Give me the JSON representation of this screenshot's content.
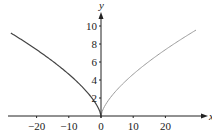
{
  "chart_data": {
    "type": "line",
    "title": "",
    "xlabel": "x",
    "ylabel": "y",
    "xlim": [
      -31,
      33
    ],
    "ylim": [
      0,
      11
    ],
    "x_ticks": [
      -20,
      -10,
      0,
      10,
      20
    ],
    "x_tick_labels": [
      "−20",
      "−10",
      "0",
      "10",
      "20"
    ],
    "y_ticks": [
      2,
      4,
      6,
      8,
      10
    ],
    "y_tick_labels": [
      "2",
      "4",
      "6",
      "8",
      "10"
    ],
    "grid": false,
    "legend": null,
    "series": [
      {
        "name": "left branch (x ≤ 0)",
        "color": "#444444",
        "x": [
          -28,
          -25,
          -20,
          -15,
          -10,
          -5,
          -2,
          0
        ],
        "y": [
          9.2,
          8.55,
          7.37,
          6.08,
          4.64,
          2.92,
          1.59,
          0
        ]
      },
      {
        "name": "right branch (x ≥ 0)",
        "color": "#9a9a9a",
        "x": [
          0,
          2,
          5,
          10,
          15,
          20,
          25,
          29.5
        ],
        "y": [
          0,
          1.59,
          2.92,
          4.64,
          6.08,
          7.37,
          8.55,
          9.55
        ]
      }
    ]
  }
}
